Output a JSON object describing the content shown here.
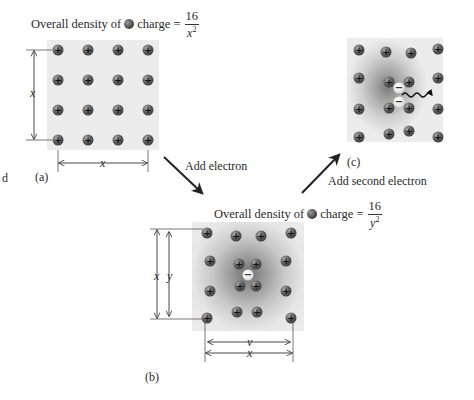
{
  "panel_a": {
    "label": "(a)",
    "title_prefix": "Overall density of",
    "title_suffix": "charge =",
    "numerator": "16",
    "denominator_var": "x",
    "denominator_exp": "2",
    "width_label": "x",
    "height_label": "x",
    "grid": "4x4",
    "charge_symbol": "+"
  },
  "panel_b": {
    "label": "(b)",
    "title_prefix": "Overall density of",
    "title_suffix": "charge =",
    "numerator": "16",
    "denominator_var": "y",
    "denominator_exp": "2",
    "inner_width_label": "y",
    "outer_width_label": "x",
    "inner_height_label": "y",
    "outer_height_label": "x",
    "electron_symbol": "−",
    "charge_symbol": "+"
  },
  "panel_c": {
    "label": "(c)",
    "electron_symbol": "−",
    "charge_symbol": "+"
  },
  "transitions": {
    "a_to_b": "Add electron",
    "b_to_c": "Add second electron"
  },
  "edge_fragment": "d",
  "colors": {
    "background": "#ffffff",
    "panel_fill": "#ececec",
    "ion_fill": "#4a4a4a",
    "electron_fill": "#f0f0f0",
    "line": "#333333"
  }
}
